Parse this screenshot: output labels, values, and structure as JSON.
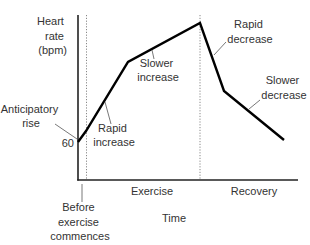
{
  "diagram": {
    "y_axis_label": [
      "Heart",
      "rate",
      "(bpm)"
    ],
    "x_axis_label": "Time",
    "baseline_tick_label": "60",
    "phases": [
      {
        "name": "before",
        "label": [
          "Before",
          "exercise",
          "commences"
        ]
      },
      {
        "name": "exercise",
        "label": "Exercise"
      },
      {
        "name": "recovery",
        "label": "Recovery"
      }
    ],
    "annotations": [
      {
        "id": "anticipatory-rise",
        "lines": [
          "Anticipatory",
          "rise"
        ]
      },
      {
        "id": "rapid-increase",
        "lines": [
          "Rapid",
          "increase"
        ]
      },
      {
        "id": "slower-increase",
        "lines": [
          "Slower",
          "increase"
        ]
      },
      {
        "id": "rapid-decrease",
        "lines": [
          "Rapid",
          "decrease"
        ]
      },
      {
        "id": "slower-decrease",
        "lines": [
          "Slower",
          "decrease"
        ]
      }
    ],
    "colors": {
      "curve": "#000000",
      "axes": "#222222",
      "text": "#333333",
      "guides": "#888888"
    }
  }
}
